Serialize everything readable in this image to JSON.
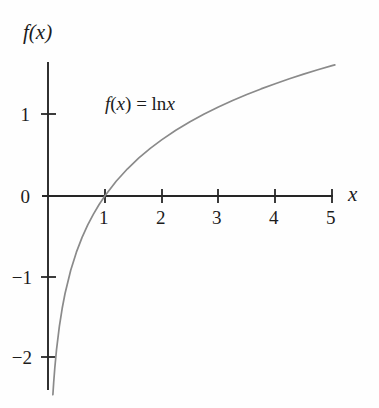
{
  "figure": {
    "caption_axis_y": "f(x)",
    "caption_axis_x": "x",
    "equation": {
      "lhs_f": "f",
      "lhs_paren_open": "(",
      "lhs_var": "x",
      "lhs_paren_close": ")",
      "equals": "=",
      "fn": "ln",
      "arg": "x",
      "full": "f(x) = ln x"
    },
    "x_tick_labels": [
      "1",
      "2",
      "3",
      "4",
      "5"
    ],
    "y_tick_labels": [
      "1",
      "0",
      "−1",
      "−2"
    ],
    "curve_color": "#8a8a8a",
    "axis_color": "#262626",
    "text_color": "#1c1c1c",
    "background_color": "#fefefe"
  },
  "chart_data": {
    "type": "line",
    "title": "",
    "subtitle": "",
    "xlabel": "x",
    "ylabel": "f(x)",
    "annotations": [
      "f(x) = ln x"
    ],
    "legend": [],
    "legend_position": "none",
    "grid": false,
    "xlim": [
      0,
      5.1
    ],
    "ylim": [
      -2.35,
      1.7
    ],
    "xticks": [
      1,
      2,
      3,
      4,
      5
    ],
    "xticklabels": [
      "1",
      "2",
      "3",
      "4",
      "5"
    ],
    "yticks": [
      1,
      0,
      -1,
      -2
    ],
    "yticklabels": [
      "1",
      "0",
      "-1",
      "-2"
    ],
    "series": [
      {
        "name": "f(x) = ln x",
        "color": "#8a8a8a",
        "x": [
          0.086,
          0.1,
          0.12,
          0.15,
          0.2,
          0.25,
          0.3,
          0.4,
          0.5,
          0.6,
          0.7,
          0.8,
          0.9,
          1.0,
          1.2,
          1.4,
          1.6,
          1.8,
          2.0,
          2.25,
          2.5,
          2.75,
          3.0,
          3.25,
          3.5,
          3.75,
          4.0,
          4.25,
          4.5,
          4.75,
          5.0,
          5.05
        ],
        "y": [
          -2.453,
          -2.303,
          -2.12,
          -1.897,
          -1.609,
          -1.386,
          -1.204,
          -0.916,
          -0.693,
          -0.511,
          -0.357,
          -0.223,
          -0.105,
          0.0,
          0.182,
          0.336,
          0.47,
          0.588,
          0.693,
          0.811,
          0.916,
          1.012,
          1.099,
          1.179,
          1.253,
          1.322,
          1.386,
          1.447,
          1.504,
          1.558,
          1.609,
          1.619
        ]
      }
    ]
  }
}
